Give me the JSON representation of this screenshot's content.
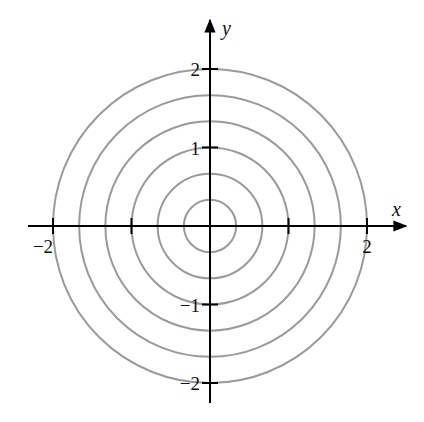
{
  "chart_data": {
    "type": "contour",
    "title": "",
    "xlabel": "x",
    "ylabel": "y",
    "xlim": [
      -2.3,
      2.5
    ],
    "ylim": [
      -2.3,
      2.6
    ],
    "grid": false,
    "legend": null,
    "x_ticks": [
      -2,
      -1,
      1,
      2
    ],
    "y_ticks": [
      -2,
      -1,
      1,
      2
    ],
    "x_tick_labels": [
      {
        "value": -2,
        "label": "−2"
      },
      {
        "value": 2,
        "label": "2"
      }
    ],
    "y_tick_labels": [
      {
        "value": 2,
        "label": "2"
      },
      {
        "value": 1,
        "label": "1"
      },
      {
        "value": -1,
        "label": "−1"
      },
      {
        "value": -2,
        "label": "−2"
      }
    ],
    "circles": {
      "center": [
        0,
        0
      ],
      "radii": [
        0.333,
        0.667,
        1.0,
        1.333,
        1.667,
        2.0
      ]
    },
    "colors": {
      "circle": "#9a9a9a",
      "axis": "#000000",
      "background": "#ffffff"
    }
  },
  "layout": {
    "origin_px": [
      210,
      226
    ],
    "unit_px": 78.5,
    "x_axis_px": [
      28,
      406
    ],
    "y_axis_px": [
      20,
      403
    ]
  }
}
